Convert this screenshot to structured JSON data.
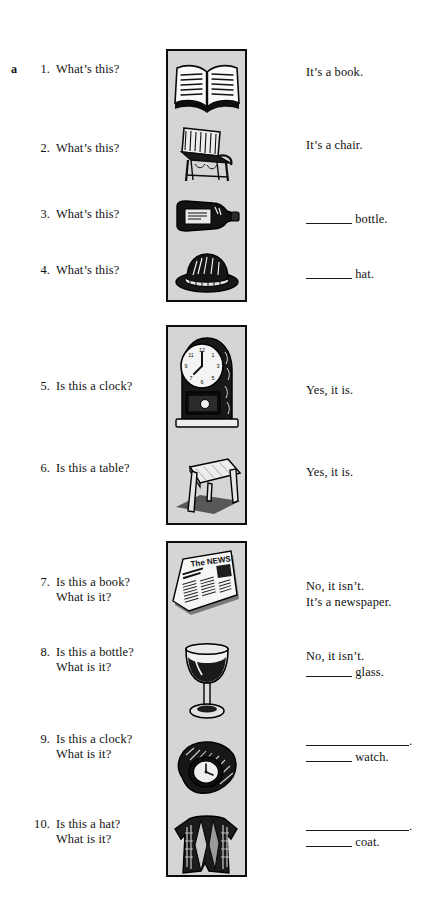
{
  "page": {
    "section_letter": "a",
    "background_color": "#ffffff",
    "panel_fill_color": "#d5d5d4",
    "ink_color": "#111111"
  },
  "exercises": [
    {
      "number": "1.",
      "question": "What’s this?",
      "question2": "",
      "picture": "open-book",
      "answer": "It’s a book.",
      "answer2": ""
    },
    {
      "number": "2.",
      "question": "What’s this?",
      "question2": "",
      "picture": "armchair",
      "answer": "It’s a chair.",
      "answer2": ""
    },
    {
      "number": "3.",
      "question": "What’s this?",
      "question2": "",
      "picture": "bottle",
      "answer_blank": "short",
      "answer": "bottle.",
      "answer2": ""
    },
    {
      "number": "4.",
      "question": "What’s this?",
      "question2": "",
      "picture": "hat",
      "answer_blank": "short",
      "answer": "hat.",
      "answer2": ""
    },
    {
      "number": "5.",
      "question": "Is this a clock?",
      "question2": "",
      "picture": "mantel-clock",
      "answer": "Yes, it is.",
      "answer2": ""
    },
    {
      "number": "6.",
      "question": "Is this a table?",
      "question2": "",
      "picture": "table",
      "answer": "Yes, it is.",
      "answer2": ""
    },
    {
      "number": "7.",
      "question": "Is this a book?",
      "question2": "What is it?",
      "picture": "newspaper",
      "answer": "No, it isn’t.",
      "answer2": "It’s a newspaper."
    },
    {
      "number": "8.",
      "question": "Is this a bottle?",
      "question2": "What is it?",
      "picture": "wine-glass",
      "answer": "No, it isn’t.",
      "answer2_blank": "short",
      "answer2": "glass."
    },
    {
      "number": "9.",
      "question": "Is this a clock?",
      "question2": "What is it?",
      "picture": "wristwatch",
      "answer_blank": "long",
      "answer": ".",
      "answer2_blank": "short",
      "answer2": "watch."
    },
    {
      "number": "10.",
      "question": "Is this a hat?",
      "question2": "What is it?",
      "picture": "coat",
      "answer_blank": "long",
      "answer": ".",
      "answer2_blank": "short",
      "answer2": "coat."
    }
  ],
  "newspaper_art": {
    "masthead": "The NEWS"
  }
}
